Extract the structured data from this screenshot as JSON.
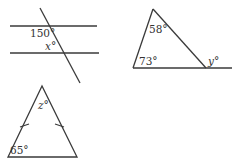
{
  "figures": [
    {
      "id": "parallel-lines",
      "description": "Two parallel lines cut by a transversal",
      "labels": {
        "angle_known": "150°",
        "angle_unknown": "x°"
      }
    },
    {
      "id": "triangle-exterior",
      "description": "Triangle with extended base showing exterior angle",
      "labels": {
        "angle_top": "58°",
        "angle_left": "73°",
        "angle_exterior": "y°"
      }
    },
    {
      "id": "isosceles-triangle",
      "description": "Isosceles triangle with two equal sides marked",
      "labels": {
        "angle_apex": "z°",
        "angle_base": "65°"
      }
    }
  ],
  "colors": {
    "stroke": "#3a3a3a",
    "text": "#333333",
    "background": "#ffffff"
  }
}
